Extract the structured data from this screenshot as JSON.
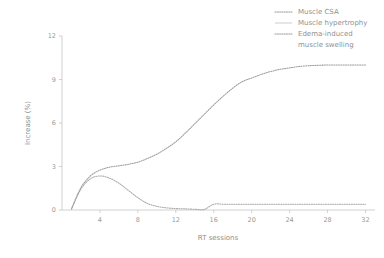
{
  "chart_data": {
    "type": "line",
    "title": "",
    "xlabel": "RT sessions",
    "ylabel": "Increase (%)",
    "xlim": [
      0,
      33
    ],
    "ylim": [
      0,
      12
    ],
    "xticks": [
      4,
      8,
      12,
      16,
      20,
      24,
      28,
      32
    ],
    "yticks": [
      0,
      3,
      6,
      9,
      12
    ],
    "grid": false,
    "legend_position": "top-right",
    "x": [
      1,
      2,
      3,
      4,
      5,
      6,
      7,
      8,
      9,
      10,
      11,
      12,
      13,
      14,
      15,
      16,
      17,
      18,
      19,
      20,
      21,
      22,
      23,
      24,
      25,
      26,
      27,
      28,
      29,
      30,
      31,
      32
    ],
    "series": [
      {
        "name": "Muscle CSA",
        "style": "dotted",
        "color": "#9b9b9b",
        "values": [
          0.1,
          1.55,
          2.35,
          2.75,
          2.95,
          3.05,
          3.15,
          3.3,
          3.55,
          3.85,
          4.25,
          4.7,
          5.3,
          5.95,
          6.6,
          7.25,
          7.85,
          8.4,
          8.85,
          9.1,
          9.35,
          9.55,
          9.7,
          9.8,
          9.9,
          9.95,
          9.98,
          10.0,
          10.0,
          10.0,
          10.0,
          10.0
        ]
      },
      {
        "name": "Muscle hypertrophy",
        "style": "solid",
        "color": "#cfcfcf",
        "values": [
          0.05,
          0.1,
          0.2,
          0.4,
          0.75,
          1.2,
          1.8,
          2.45,
          3.1,
          3.6,
          4.1,
          4.6,
          5.1,
          5.7,
          6.25,
          6.85,
          7.45,
          8.0,
          8.5,
          8.85,
          9.15,
          9.4,
          9.6,
          9.75,
          9.85,
          9.92,
          9.96,
          9.98,
          10.0,
          10.0,
          10.0,
          10.0
        ]
      },
      {
        "name": "Edema-induced muscle swelling",
        "style": "dotted",
        "color": "#a8a8a8",
        "values": [
          0.05,
          1.45,
          2.15,
          2.35,
          2.2,
          1.85,
          1.35,
          0.85,
          0.45,
          0.25,
          0.15,
          0.1,
          0.08,
          0.05,
          0.04,
          0.4,
          0.4,
          0.4,
          0.4,
          0.4,
          0.4,
          0.4,
          0.4,
          0.4,
          0.4,
          0.4,
          0.4,
          0.4,
          0.4,
          0.4,
          0.4,
          0.4
        ]
      }
    ]
  },
  "axes": {
    "x_title": "RT sessions",
    "y_title": "Increase (%)",
    "x_tick_labels": [
      "4",
      "8",
      "12",
      "16",
      "20",
      "24",
      "28",
      "32"
    ],
    "y_tick_labels": [
      "0",
      "3",
      "6",
      "9",
      "12"
    ]
  },
  "legend": {
    "items": [
      {
        "label": "Muscle CSA",
        "label_line2": "",
        "style": "dotted"
      },
      {
        "label": "Muscle hypertrophy",
        "label_line2": "",
        "style": "solid"
      },
      {
        "label": "Edema-induced",
        "label_line2": "muscle swelling",
        "style": "dotted"
      }
    ]
  }
}
